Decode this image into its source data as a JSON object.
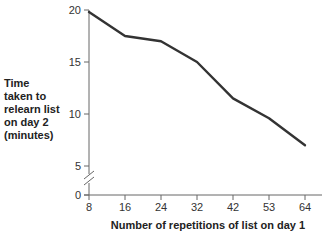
{
  "chart_data": {
    "type": "line",
    "title": "",
    "xlabel": "Number of repetitions of list on day 1",
    "ylabel": "Time taken to relearn list on day 2 (minutes)",
    "ylabel_lines": [
      "Time",
      "taken to",
      "relearn list",
      "on day 2",
      "(minutes)"
    ],
    "categories": [
      "8",
      "16",
      "24",
      "32",
      "42",
      "53",
      "64"
    ],
    "x": [
      8,
      16,
      24,
      32,
      42,
      53,
      64
    ],
    "values": [
      19.8,
      17.5,
      17.0,
      15.0,
      11.5,
      9.6,
      7.0
    ],
    "yticks": [
      0,
      5,
      10,
      15,
      20
    ],
    "ylim": [
      0,
      20
    ],
    "y_axis_break": true,
    "grid": false,
    "legend": null,
    "line_color": "#333333"
  }
}
